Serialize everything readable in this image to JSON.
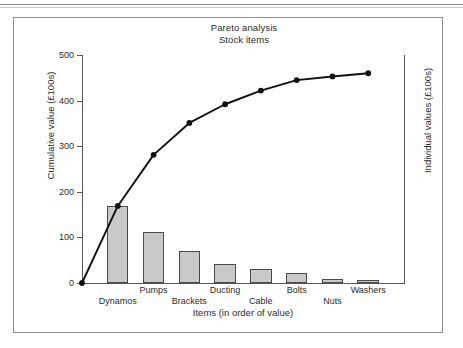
{
  "figure": {
    "title": "Pareto analysis",
    "subtitle": "Stock items"
  },
  "axes": {
    "y_left_title": "Cumulative value (£100s)",
    "y_right_title": "Individual values (£100s)",
    "x_title": "Items (in order of value)",
    "y_ticks": [
      "0",
      "100",
      "200",
      "300",
      "400",
      "500"
    ]
  },
  "chart_data": {
    "type": "bar",
    "title": "Pareto analysis",
    "subtitle": "Stock items",
    "xlabel": "Items (in order of value)",
    "ylabel": "Cumulative value (£100s)",
    "ylabel_secondary": "Individual values (£100s)",
    "ylim": [
      0,
      500
    ],
    "yticks": [
      0,
      100,
      200,
      300,
      400,
      500
    ],
    "grid": false,
    "legend": "none",
    "categories": [
      "Dynamos",
      "Pumps",
      "Brackets",
      "Ducting",
      "Cable",
      "Bolts",
      "Nuts",
      "Washers"
    ],
    "series": [
      {
        "name": "Individual values (£100s)",
        "type": "bar",
        "values": [
          169,
          112,
          70,
          41,
          30,
          23,
          8,
          7
        ],
        "fill_color": "#c9c9c9",
        "edge_color": "#4a4a4a"
      },
      {
        "name": "Cumulative value (£100s)",
        "type": "line",
        "x": [
          "origin",
          "Dynamos",
          "Pumps",
          "Brackets",
          "Ducting",
          "Cable",
          "Bolts",
          "Nuts",
          "Washers"
        ],
        "values": [
          0,
          169,
          281,
          351,
          392,
          422,
          445,
          453,
          460
        ],
        "color": "#111111",
        "marker": "circle"
      }
    ]
  },
  "colors": {
    "bar_fill": "#c9c9c9",
    "bar_edge": "#4a4a4a",
    "line": "#111111",
    "axis": "#555555",
    "frame": "#8e8e8e",
    "text": "#2b2b2b"
  }
}
